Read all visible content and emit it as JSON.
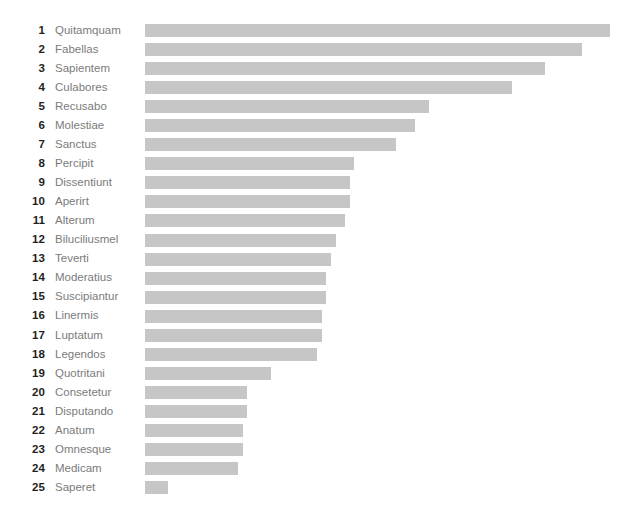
{
  "chart": {
    "type": "bar",
    "orientation": "horizontal",
    "title": "",
    "subtitle": "",
    "xlabel": "",
    "ylabel": "",
    "grid": false,
    "legend": false,
    "bar_color": "#c6c6c6",
    "rank_color": "#231f20",
    "label_color": "#7b7b7b",
    "background_color": "#ffffff"
  },
  "chart_data": {
    "type": "bar",
    "orientation": "horizontal",
    "title": "",
    "xlabel": "",
    "ylabel": "",
    "grid": false,
    "legend": false,
    "xlim": [
      0,
      100
    ],
    "categories": [
      "Quitamquam",
      "Fabellas",
      "Sapientem",
      "Culabores",
      "Recusabo",
      "Molestiae",
      "Sanctus",
      "Percipit",
      "Dissentiunt",
      "Aperirt",
      "Alterum",
      "Biluciliusmel",
      "Teverti",
      "Moderatius",
      "Suscipiantur",
      "Linermis",
      "Luptatum",
      "Legendos",
      "Quotritani",
      "Consetetur",
      "Disputando",
      "Anatum",
      "Omnesque",
      "Medicam",
      "Saperet"
    ],
    "ranks": [
      1,
      2,
      3,
      4,
      5,
      6,
      7,
      8,
      9,
      10,
      11,
      12,
      13,
      14,
      15,
      16,
      17,
      18,
      19,
      20,
      21,
      22,
      23,
      24,
      25
    ],
    "values": [
      100,
      94,
      86,
      79,
      61,
      58,
      54,
      45,
      44,
      44,
      43,
      41,
      40,
      39,
      39,
      38,
      38,
      37,
      27,
      22,
      22,
      21,
      21,
      20,
      5
    ]
  },
  "rows": [
    {
      "rank": "1",
      "label": "Quitamquam",
      "value": 100
    },
    {
      "rank": "2",
      "label": "Fabellas",
      "value": 94
    },
    {
      "rank": "3",
      "label": "Sapientem",
      "value": 86
    },
    {
      "rank": "4",
      "label": "Culabores",
      "value": 79
    },
    {
      "rank": "5",
      "label": "Recusabo",
      "value": 61
    },
    {
      "rank": "6",
      "label": "Molestiae",
      "value": 58
    },
    {
      "rank": "7",
      "label": "Sanctus",
      "value": 54
    },
    {
      "rank": "8",
      "label": "Percipit",
      "value": 45
    },
    {
      "rank": "9",
      "label": "Dissentiunt",
      "value": 44
    },
    {
      "rank": "10",
      "label": "Aperirt",
      "value": 44
    },
    {
      "rank": "11",
      "label": "Alterum",
      "value": 43
    },
    {
      "rank": "12",
      "label": "Biluciliusmel",
      "value": 41
    },
    {
      "rank": "13",
      "label": "Teverti",
      "value": 40
    },
    {
      "rank": "14",
      "label": "Moderatius",
      "value": 39
    },
    {
      "rank": "15",
      "label": "Suscipiantur",
      "value": 39
    },
    {
      "rank": "16",
      "label": "Linermis",
      "value": 38
    },
    {
      "rank": "17",
      "label": "Luptatum",
      "value": 38
    },
    {
      "rank": "18",
      "label": "Legendos",
      "value": 37
    },
    {
      "rank": "19",
      "label": "Quotritani",
      "value": 27
    },
    {
      "rank": "20",
      "label": "Consetetur",
      "value": 22
    },
    {
      "rank": "21",
      "label": "Disputando",
      "value": 22
    },
    {
      "rank": "22",
      "label": "Anatum",
      "value": 21
    },
    {
      "rank": "23",
      "label": "Omnesque",
      "value": 21
    },
    {
      "rank": "24",
      "label": "Medicam",
      "value": 20
    },
    {
      "rank": "25",
      "label": "Saperet",
      "value": 5
    }
  ]
}
